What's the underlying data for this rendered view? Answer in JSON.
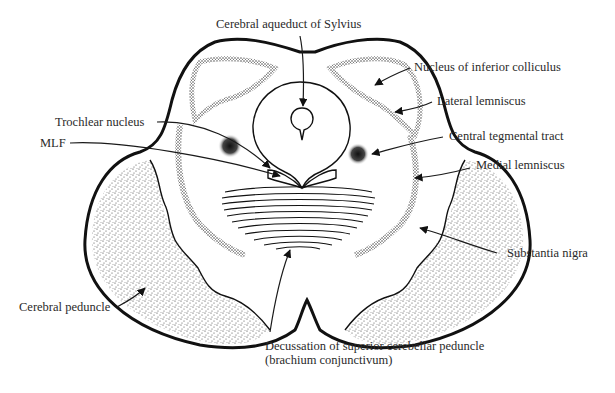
{
  "figure": {
    "labels": {
      "aqueduct": "Cerebral aqueduct of Sylvius",
      "inferior_colliculus": "Nucleus of inferior colliculus",
      "lateral_lemniscus": "Lateral lemniscus",
      "trochlear_nucleus": "Trochlear nucleus",
      "mlf": "MLF",
      "central_tegmental_tract": "Central tegmental tract",
      "medial_lemniscus": "Medial lemniscus",
      "substantia_nigra": "Substantia nigra",
      "cerebral_peduncle": "Cerebral peduncle",
      "decussation_line1": "Decussation of superior cerebellar peduncle",
      "decussation_line2": "(brachium conjunctivum)"
    },
    "colors": {
      "ink": "#111111",
      "background": "#ffffff",
      "label_text": "#2a2a2a"
    }
  }
}
